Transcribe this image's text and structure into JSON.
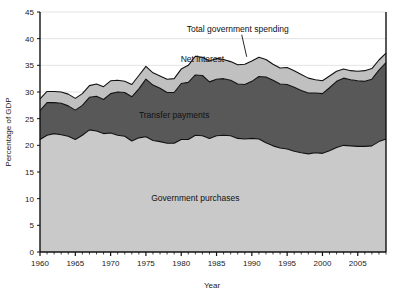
{
  "chart_data": {
    "type": "area",
    "stacked": true,
    "title": "",
    "subtitle": "",
    "xlabel": "Year",
    "ylabel": "Percentage of GDP",
    "xlim": [
      1960,
      2009
    ],
    "ylim": [
      0,
      45
    ],
    "yticks": [
      0,
      5,
      10,
      15,
      20,
      25,
      30,
      35,
      40,
      45
    ],
    "xticks": [
      1960,
      1965,
      1970,
      1975,
      1980,
      1985,
      1990,
      1995,
      2000,
      2005
    ],
    "xminor_step": 1,
    "grid": "horizontal",
    "legend_position": "inline-annotations",
    "annotations": [
      {
        "text": "Total government spending",
        "points_to": "top-boundary",
        "x": 1988,
        "y": 41.2
      },
      {
        "text": "Net interest",
        "points_to": "band-net-interest",
        "x": 1983,
        "y": 35.6
      },
      {
        "text": "Transfer payments",
        "points_to": "band-transfer-payments",
        "x": 1979,
        "y": 25.2
      },
      {
        "text": "Government purchases",
        "points_to": "band-government-purchases",
        "x": 1982,
        "y": 9.5
      }
    ],
    "x": [
      1960,
      1961,
      1962,
      1963,
      1964,
      1965,
      1966,
      1967,
      1968,
      1969,
      1970,
      1971,
      1972,
      1973,
      1974,
      1975,
      1976,
      1977,
      1978,
      1979,
      1980,
      1981,
      1982,
      1983,
      1984,
      1985,
      1986,
      1987,
      1988,
      1989,
      1990,
      1991,
      1992,
      1993,
      1994,
      1995,
      1996,
      1997,
      1998,
      1999,
      2000,
      2001,
      2002,
      2003,
      2004,
      2005,
      2006,
      2007,
      2008,
      2009
    ],
    "series": [
      {
        "name": "Government purchases",
        "color": "#c9c9c9",
        "values": [
          21.1,
          21.9,
          22.2,
          22.0,
          21.7,
          21.1,
          21.9,
          22.9,
          22.7,
          22.2,
          22.3,
          21.9,
          21.7,
          20.8,
          21.4,
          21.6,
          20.9,
          20.7,
          20.4,
          20.4,
          21.1,
          21.1,
          21.9,
          21.8,
          21.3,
          21.8,
          21.9,
          21.8,
          21.3,
          21.2,
          21.3,
          21.2,
          20.5,
          19.9,
          19.5,
          19.3,
          18.9,
          18.6,
          18.4,
          18.6,
          18.5,
          19.0,
          19.6,
          20.0,
          19.9,
          19.8,
          19.8,
          19.9,
          20.7,
          21.2
        ]
      },
      {
        "name": "Transfer payments",
        "color": "#585858",
        "values": [
          5.4,
          6.1,
          5.8,
          5.9,
          5.7,
          5.5,
          5.6,
          6.1,
          6.5,
          6.4,
          7.4,
          8.1,
          8.2,
          8.3,
          9.2,
          10.8,
          10.4,
          10.0,
          9.5,
          9.5,
          10.5,
          10.7,
          11.3,
          11.3,
          10.6,
          10.6,
          10.6,
          10.4,
          10.2,
          10.2,
          10.7,
          11.7,
          12.3,
          12.3,
          12.0,
          12.1,
          12.0,
          11.7,
          11.4,
          11.2,
          11.2,
          11.8,
          12.4,
          12.6,
          12.4,
          12.3,
          12.2,
          12.5,
          13.4,
          14.3
        ]
      },
      {
        "name": "Net interest",
        "color": "#c0c0c0",
        "values": [
          2.2,
          2.1,
          2.1,
          2.1,
          2.2,
          2.2,
          2.2,
          2.2,
          2.3,
          2.4,
          2.4,
          2.2,
          2.1,
          2.3,
          2.5,
          2.4,
          2.3,
          2.3,
          2.5,
          2.6,
          2.7,
          3.2,
          3.5,
          3.4,
          3.9,
          3.9,
          3.6,
          3.5,
          3.6,
          3.8,
          3.8,
          3.6,
          3.3,
          3.0,
          3.0,
          3.2,
          3.1,
          3.0,
          2.8,
          2.5,
          2.4,
          2.2,
          1.9,
          1.7,
          1.7,
          1.8,
          2.0,
          2.0,
          1.9,
          1.8
        ]
      }
    ],
    "totals_name": "Total government spending",
    "totals": [
      28.7,
      30.1,
      30.1,
      30.0,
      29.6,
      28.8,
      29.7,
      31.2,
      31.5,
      31.0,
      32.1,
      32.2,
      32.0,
      31.4,
      33.1,
      34.8,
      33.6,
      33.0,
      32.4,
      32.5,
      34.3,
      35.0,
      36.7,
      36.5,
      35.8,
      36.3,
      36.1,
      35.7,
      35.1,
      35.2,
      35.8,
      36.5,
      36.1,
      35.2,
      34.5,
      34.6,
      34.0,
      33.3,
      32.6,
      32.3,
      32.1,
      33.0,
      33.9,
      34.3,
      34.0,
      33.9,
      34.0,
      34.4,
      36.0,
      37.3
    ]
  }
}
